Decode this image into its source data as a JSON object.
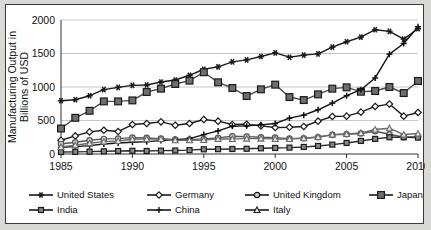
{
  "chart_data": {
    "type": "line",
    "title": "",
    "xlabel": "",
    "ylabel": "Manufacturing Output in Billions of USD",
    "ylabel_lines": [
      "Manufacturing Output in",
      "Billions of USD"
    ],
    "x": [
      1985,
      1986,
      1987,
      1988,
      1989,
      1990,
      1991,
      1992,
      1993,
      1994,
      1995,
      1996,
      1997,
      1998,
      1999,
      2000,
      2001,
      2002,
      2003,
      2004,
      2005,
      2006,
      2007,
      2008,
      2009,
      2010
    ],
    "xlim": [
      1985,
      2010
    ],
    "ylim": [
      0,
      2000
    ],
    "xticks": [
      "1985",
      "1990",
      "1995",
      "2000",
      "2005",
      "2010"
    ],
    "xtick_values": [
      1985,
      1990,
      1995,
      2000,
      2005,
      2010
    ],
    "yticks": [
      "0",
      "500",
      "1000",
      "1500",
      "2000"
    ],
    "ytick_values": [
      0,
      500,
      1000,
      1500,
      2000
    ],
    "grid": "horizontal",
    "legend_position": "bottom",
    "legend_columns": 4,
    "series": [
      {
        "name": "United States",
        "marker": "asterisk",
        "color": "#1a1a1a",
        "values": [
          795,
          810,
          870,
          960,
          995,
          1025,
          1030,
          1075,
          1105,
          1175,
          1265,
          1300,
          1375,
          1405,
          1455,
          1510,
          1445,
          1475,
          1495,
          1595,
          1675,
          1745,
          1855,
          1830,
          1715,
          1870
        ]
      },
      {
        "name": "Germany",
        "marker": "diamond-open",
        "color": "#1a1a1a",
        "values": [
          205,
          270,
          330,
          355,
          335,
          440,
          455,
          480,
          430,
          455,
          515,
          490,
          440,
          445,
          420,
          395,
          400,
          410,
          490,
          560,
          565,
          625,
          710,
          745,
          565,
          620
        ]
      },
      {
        "name": "United Kingdom",
        "marker": "circle-open",
        "color": "#555555",
        "values": [
          150,
          175,
          205,
          225,
          230,
          245,
          240,
          230,
          215,
          215,
          225,
          240,
          265,
          260,
          250,
          245,
          230,
          235,
          250,
          285,
          295,
          305,
          340,
          295,
          250,
          260
        ]
      },
      {
        "name": "Japan",
        "marker": "square-filled",
        "color": "#4a4a4a",
        "values": [
          380,
          540,
          645,
          785,
          785,
          800,
          925,
          975,
          1045,
          1095,
          1220,
          1070,
          985,
          865,
          965,
          1035,
          850,
          805,
          890,
          975,
          995,
          930,
          940,
          1000,
          910,
          1090
        ]
      },
      {
        "name": "India",
        "marker": "square-small",
        "color": "#2b2b2b",
        "values": [
          30,
          32,
          35,
          40,
          45,
          48,
          45,
          50,
          52,
          58,
          70,
          72,
          75,
          78,
          85,
          90,
          95,
          105,
          120,
          140,
          165,
          195,
          225,
          250,
          250,
          245
        ]
      },
      {
        "name": "China",
        "marker": "plus",
        "color": "#111111",
        "values": [
          100,
          110,
          125,
          150,
          165,
          175,
          185,
          200,
          215,
          230,
          290,
          345,
          415,
          420,
          435,
          455,
          535,
          580,
          660,
          760,
          870,
          960,
          1135,
          1490,
          1650,
          1900
        ]
      },
      {
        "name": "Italy",
        "marker": "triangle-open",
        "color": "#6a6a6a",
        "values": [
          105,
          130,
          160,
          185,
          195,
          220,
          225,
          225,
          205,
          205,
          210,
          225,
          225,
          230,
          230,
          225,
          225,
          235,
          255,
          290,
          300,
          315,
          365,
          385,
          290,
          305
        ]
      }
    ]
  },
  "legend": {
    "rows": [
      [
        {
          "label": "United States",
          "marker": "asterisk"
        },
        {
          "label": "Germany",
          "marker": "diamond-open"
        },
        {
          "label": "United Kingdom",
          "marker": "circle-open"
        },
        {
          "label": "Japan",
          "marker": "square-filled"
        }
      ],
      [
        {
          "label": "India",
          "marker": "square-small"
        },
        {
          "label": "China",
          "marker": "plus"
        },
        {
          "label": "Italy",
          "marker": "triangle-open"
        }
      ]
    ]
  }
}
